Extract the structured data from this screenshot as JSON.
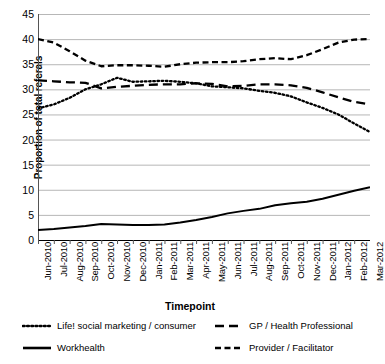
{
  "chart_data": {
    "type": "line",
    "title": "",
    "xlabel": "Timepoint",
    "ylabel": "Proportion of total referals",
    "ylim": [
      0,
      45
    ],
    "ytick_step": 5,
    "yticks": [
      0,
      5,
      10,
      15,
      20,
      25,
      30,
      35,
      40,
      45
    ],
    "grid": true,
    "legend_position": "bottom",
    "categories": [
      "Jun-2010",
      "Jul-2010",
      "Aug-2010",
      "Sep-2010",
      "Oct-2010",
      "Nov-2010",
      "Dec-2010",
      "Jan-2011",
      "Feb-2011",
      "Mar-2011",
      "Apr-2011",
      "May-2011",
      "Jun-2011",
      "Jul-2011",
      "Aug-2011",
      "Sep-2011",
      "Oct-2011",
      "Nov-2011",
      "Dec-2011",
      "Jan-2012",
      "Feb-2012",
      "Mar-2012"
    ],
    "series": [
      {
        "name": "Life! social marketing / consumer",
        "style": "dotted",
        "color": "#000000",
        "values": [
          26.2,
          27.0,
          28.3,
          30.0,
          31.0,
          32.3,
          31.5,
          31.6,
          31.7,
          31.5,
          31.2,
          30.6,
          30.4,
          30.2,
          29.7,
          29.3,
          28.6,
          27.4,
          26.3,
          25.0,
          23.2,
          21.5
        ]
      },
      {
        "name": "GP / Health Professional",
        "style": "dashed-long",
        "color": "#000000",
        "values": [
          31.8,
          31.6,
          31.4,
          31.3,
          30.2,
          30.5,
          30.7,
          30.9,
          31.0,
          31.0,
          31.2,
          31.1,
          30.6,
          30.7,
          31.0,
          31.0,
          30.8,
          30.3,
          29.4,
          28.4,
          27.5,
          27.0
        ]
      },
      {
        "name": "Workhealth",
        "style": "solid",
        "color": "#000000",
        "values": [
          2.0,
          2.2,
          2.5,
          2.8,
          3.2,
          3.1,
          3.0,
          3.0,
          3.1,
          3.5,
          4.0,
          4.6,
          5.3,
          5.8,
          6.2,
          6.9,
          7.3,
          7.6,
          8.2,
          9.0,
          9.8,
          10.5
        ]
      },
      {
        "name": "Provider / Facilitator",
        "style": "dashed-med",
        "color": "#000000",
        "values": [
          40.0,
          39.3,
          37.6,
          35.7,
          34.6,
          34.8,
          34.8,
          34.7,
          34.5,
          35.0,
          35.3,
          35.4,
          35.4,
          35.6,
          36.0,
          36.2,
          36.0,
          36.8,
          38.0,
          39.3,
          39.9,
          40.0
        ]
      }
    ]
  },
  "legend": {
    "items": [
      {
        "label": "Life! social marketing / consumer"
      },
      {
        "label": "GP / Health Professional"
      },
      {
        "label": "Workhealth"
      },
      {
        "label": "Provider / Facilitator"
      }
    ]
  }
}
